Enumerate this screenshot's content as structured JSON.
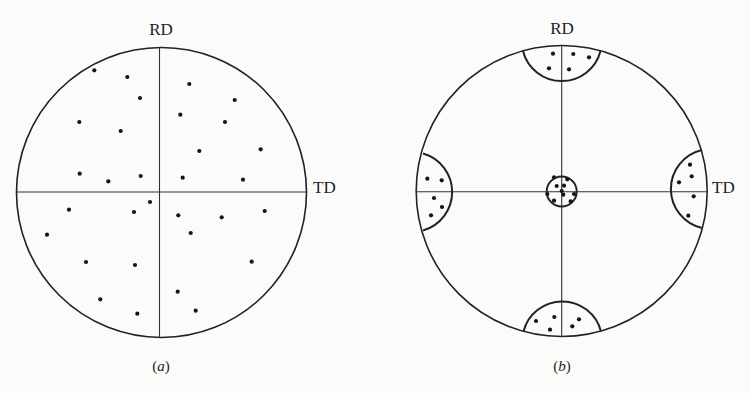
{
  "figure": {
    "panels": [
      {
        "id": "a",
        "caption": "(a)",
        "caption_letter": "a",
        "label_top": "RD",
        "label_right": "TD",
        "center": [
          161.5,
          192
        ],
        "radius": 145,
        "description": "Random orientation: poles scattered uniformly",
        "poles": [
          [
            94.3,
            70.3
          ],
          [
            127.3,
            77
          ],
          [
            140,
            98
          ],
          [
            79.3,
            122
          ],
          [
            120.7,
            131
          ],
          [
            79.7,
            173.7
          ],
          [
            108.3,
            181.3
          ],
          [
            140.7,
            176
          ],
          [
            189.3,
            84
          ],
          [
            234.7,
            100
          ],
          [
            180.3,
            114.7
          ],
          [
            225,
            122
          ],
          [
            199.3,
            151
          ],
          [
            260.7,
            149.3
          ],
          [
            182.7,
            177.7
          ],
          [
            243,
            179.7
          ],
          [
            69,
            209.7
          ],
          [
            134,
            212
          ],
          [
            150,
            202
          ],
          [
            47,
            234.7
          ],
          [
            86,
            262
          ],
          [
            135,
            265
          ],
          [
            100.3,
            299.3
          ],
          [
            137.3,
            313.7
          ],
          [
            178.3,
            215.3
          ],
          [
            221.7,
            217.3
          ],
          [
            264.7,
            211
          ],
          [
            190.7,
            233
          ],
          [
            251.7,
            261.7
          ],
          [
            177.7,
            291.7
          ],
          [
            195.7,
            310.7
          ]
        ]
      },
      {
        "id": "b",
        "caption": "(b)",
        "caption_letter": "b",
        "label_top": "RD",
        "label_right": "TD",
        "center": [
          561.7,
          191
        ],
        "radius": 146,
        "description": "Preferred orientation (texture): poles clustered in regions",
        "clusters": [
          {
            "name": "center",
            "shape": "circle",
            "cx": 561.7,
            "cy": 191.5,
            "r": 15,
            "poles": [
              [
                554,
                177.3
              ],
              [
                567.3,
                179.3
              ],
              [
                556.7,
                186
              ],
              [
                564,
                185.7
              ],
              [
                547.3,
                194
              ],
              [
                563.3,
                194.7
              ],
              [
                574,
                194
              ],
              [
                554,
                200.7
              ],
              [
                570.7,
                201.3
              ],
              [
                561.7,
                191
              ]
            ]
          },
          {
            "name": "top",
            "shape": "cap",
            "poles": [
              [
                553,
                53.7
              ],
              [
                573.3,
                54
              ],
              [
                589,
                57.3
              ],
              [
                549,
                68.3
              ],
              [
                569,
                69.3
              ]
            ]
          },
          {
            "name": "bottom",
            "shape": "cap",
            "poles": [
              [
                536,
                321
              ],
              [
                554.3,
                317
              ],
              [
                550,
                329.7
              ],
              [
                579,
                319.3
              ],
              [
                572.3,
                326.3
              ]
            ]
          },
          {
            "name": "left",
            "shape": "cap",
            "poles": [
              [
                427.3,
                178.7
              ],
              [
                441.7,
                180.3
              ],
              [
                434,
                198
              ],
              [
                442,
                207
              ],
              [
                431,
                215.3
              ]
            ]
          },
          {
            "name": "right",
            "shape": "cap",
            "poles": [
              [
                690,
                164.7
              ],
              [
                691.7,
                176.3
              ],
              [
                679,
                182.3
              ],
              [
                693.7,
                196.3
              ],
              [
                688.3,
                215.7
              ]
            ]
          }
        ]
      }
    ],
    "colors": {
      "background": "#fbfbfa",
      "ink": "#1e1e1e"
    }
  }
}
